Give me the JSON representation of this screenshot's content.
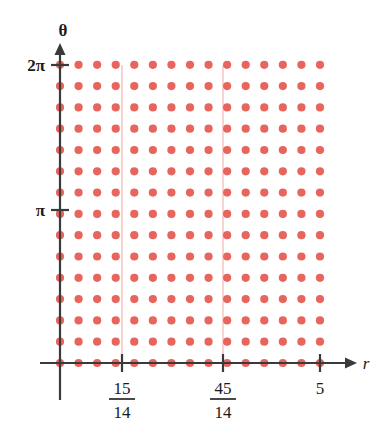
{
  "figure": {
    "name": "polar-lattice-grid-plot",
    "background_color": "#ffffff",
    "dot_color": "#e8655d",
    "axis_color": "#3a3a3a",
    "guide_color": "#f3b0ab"
  },
  "axes": {
    "x": {
      "label": "r",
      "label_is_italic": true,
      "arrow": true,
      "ticks": [
        {
          "id": "tick-15-14",
          "type": "fraction",
          "numerator": "15",
          "denominator": "14",
          "x_px": 122
        },
        {
          "id": "tick-45-14",
          "type": "fraction",
          "numerator": "45",
          "denominator": "14",
          "x_px": 223
        },
        {
          "id": "tick-5",
          "type": "plain",
          "label": "5",
          "x_px": 320
        }
      ]
    },
    "y": {
      "label": "θ",
      "label_is_italic": false,
      "arrow": true,
      "ticks": [
        {
          "id": "tick-pi",
          "label": "π",
          "y_px": 210
        },
        {
          "id": "tick-2pi",
          "label": "2π",
          "y_px": 65
        }
      ]
    }
  },
  "chart_data": {
    "type": "scatter",
    "title": "",
    "xlabel": "r",
    "ylabel": "θ",
    "xlim": [
      0,
      5.57
    ],
    "ylim": [
      0,
      6.5973
    ],
    "grid": false,
    "legend": null,
    "x_tick_labels": [
      "15/14",
      "45/14",
      "5"
    ],
    "x_tick_values": [
      1.0714,
      3.2143,
      5
    ],
    "y_tick_labels": [
      "π",
      "2π"
    ],
    "y_tick_values": [
      3.14159,
      6.28319
    ],
    "series": [
      {
        "name": "lattice-points",
        "marker": "circle",
        "color": "#e8655d",
        "columns": 15,
        "rows": 15,
        "x_values": [
          0,
          0.357,
          0.714,
          1.071,
          1.429,
          1.786,
          2.143,
          2.5,
          2.857,
          3.214,
          3.571,
          3.929,
          4.286,
          4.643,
          5
        ],
        "y_values": [
          0,
          0.449,
          0.898,
          1.346,
          1.795,
          2.244,
          2.693,
          3.142,
          3.59,
          4.039,
          4.488,
          4.937,
          5.386,
          5.834,
          6.283
        ]
      }
    ],
    "annotations": [
      {
        "name": "guide-line-15-14",
        "type": "vline",
        "x": 1.0714,
        "color": "#f3b0ab"
      },
      {
        "name": "guide-line-45-14",
        "type": "vline",
        "x": 3.2143,
        "color": "#f3b0ab"
      }
    ]
  },
  "geometry": {
    "origin_px": {
      "x": 60,
      "y": 363
    },
    "dot_spacing_px": {
      "x": 18.57,
      "y": 21.3
    },
    "columns": 15,
    "rows": 15,
    "x_axis_end_px": 352,
    "y_axis_top_px": 48,
    "y_axis_bottom_px": 400
  }
}
